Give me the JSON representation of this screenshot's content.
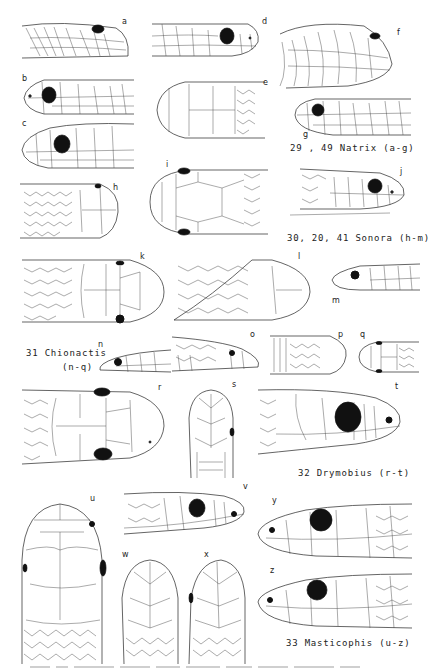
{
  "plate": {
    "background": "#ffffff",
    "ink_color": "#222222"
  },
  "figures": [
    {
      "id": "a",
      "label": "a",
      "view": "lateral",
      "genus": "Natrix"
    },
    {
      "id": "b",
      "label": "b",
      "view": "lateral",
      "genus": "Natrix"
    },
    {
      "id": "c",
      "label": "c",
      "view": "lateral",
      "genus": "Natrix"
    },
    {
      "id": "d",
      "label": "d",
      "view": "lateral",
      "genus": "Natrix"
    },
    {
      "id": "e",
      "label": "e",
      "view": "dorsal",
      "genus": "Natrix"
    },
    {
      "id": "f",
      "label": "f",
      "view": "lateral",
      "genus": "Natrix"
    },
    {
      "id": "g",
      "label": "g",
      "view": "lateral",
      "genus": "Natrix"
    },
    {
      "id": "h",
      "label": "h",
      "view": "dorsal",
      "genus": "Sonora"
    },
    {
      "id": "i",
      "label": "i",
      "view": "dorsal",
      "genus": "Sonora"
    },
    {
      "id": "j",
      "label": "j",
      "view": "lateral",
      "genus": "Sonora"
    },
    {
      "id": "k",
      "label": "k",
      "view": "dorsal",
      "genus": "Sonora"
    },
    {
      "id": "l",
      "label": "l",
      "view": "dorsal",
      "genus": "Sonora"
    },
    {
      "id": "m",
      "label": "m",
      "view": "lateral",
      "genus": "Sonora"
    },
    {
      "id": "n",
      "label": "n",
      "view": "lateral",
      "genus": "Chionactis"
    },
    {
      "id": "o",
      "label": "o",
      "view": "lateral",
      "genus": "Chionactis"
    },
    {
      "id": "p",
      "label": "p",
      "view": "ventral",
      "genus": "Chionactis"
    },
    {
      "id": "q",
      "label": "q",
      "view": "dorsal",
      "genus": "Chionactis"
    },
    {
      "id": "r",
      "label": "r",
      "view": "dorsal",
      "genus": "Drymobius"
    },
    {
      "id": "s",
      "label": "s",
      "view": "ventral",
      "genus": "Drymobius"
    },
    {
      "id": "t",
      "label": "t",
      "view": "lateral",
      "genus": "Drymobius"
    },
    {
      "id": "u",
      "label": "u",
      "view": "dorsal",
      "genus": "Masticophis"
    },
    {
      "id": "v",
      "label": "v",
      "view": "lateral",
      "genus": "Masticophis"
    },
    {
      "id": "w",
      "label": "w",
      "view": "ventral",
      "genus": "Masticophis"
    },
    {
      "id": "x",
      "label": "x",
      "view": "ventral",
      "genus": "Masticophis"
    },
    {
      "id": "y",
      "label": "y",
      "view": "lateral",
      "genus": "Masticophis"
    },
    {
      "id": "z",
      "label": "z",
      "view": "lateral",
      "genus": "Masticophis"
    }
  ],
  "captions": {
    "natrix": "29 , 49  Natrix   (a-g)",
    "sonora": "30, 20, 41  Sonora   (h-m)",
    "chionactis_line1": "31  Chionactis",
    "chionactis_line2": "(n-q)",
    "drymobius": "32   Drymobius  (r-t)",
    "masticophis": "33 Masticophis   (u-z)"
  }
}
